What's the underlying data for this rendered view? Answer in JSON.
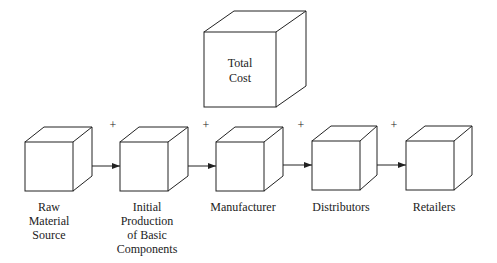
{
  "diagram": {
    "total_cost": {
      "lines": [
        "Total",
        "Cost"
      ]
    },
    "stages": [
      {
        "lines": [
          "Raw",
          "Material",
          "Source"
        ]
      },
      {
        "lines": [
          "Initial",
          "Production",
          "of Basic",
          "Components"
        ]
      },
      {
        "lines": [
          "Manufacturer"
        ]
      },
      {
        "lines": [
          "Distributors"
        ]
      },
      {
        "lines": [
          "Retailers"
        ]
      }
    ],
    "plus_signs": [
      "+",
      "+",
      "+",
      "+"
    ],
    "colors": {
      "line": "#222222",
      "background": "#ffffff"
    }
  }
}
